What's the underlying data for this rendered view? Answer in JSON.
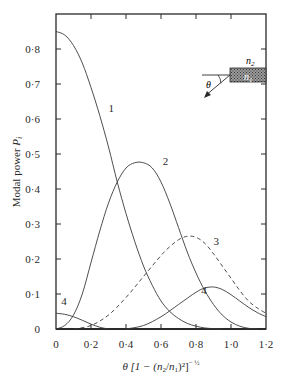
{
  "chart_data": {
    "type": "line",
    "title": "",
    "xlabel": "θ [1 − (n2/n1)²]^(−1/2)",
    "ylabel": "Modal power P_i",
    "xlim": [
      0,
      1.2
    ],
    "ylim": [
      0,
      0.9
    ],
    "grid": false,
    "legend": "none (curves labelled inline 1–4)",
    "x_ticks": [
      "0",
      "0·2",
      "0·4",
      "0·6",
      "0·8",
      "1·0",
      "1·2"
    ],
    "y_ticks": [
      "0",
      "0·1",
      "0·2",
      "0·3",
      "0·4",
      "0·5",
      "0·6",
      "0·7",
      "0·8"
    ],
    "inset": {
      "labels": [
        "n2",
        "n1",
        "θ"
      ],
      "description": "fibre end-face with ray incident at angle θ"
    },
    "series": [
      {
        "name": "1",
        "style": "solid",
        "x": [
          0,
          0.05,
          0.1,
          0.15,
          0.2,
          0.25,
          0.3,
          0.35,
          0.4,
          0.45,
          0.5,
          0.55,
          0.6,
          0.65,
          0.7,
          0.75,
          0.8,
          0.85,
          0.9,
          0.95
        ],
        "y": [
          0.85,
          0.84,
          0.81,
          0.76,
          0.69,
          0.61,
          0.52,
          0.42,
          0.33,
          0.25,
          0.18,
          0.125,
          0.08,
          0.05,
          0.03,
          0.016,
          0.008,
          0.003,
          0.001,
          0
        ]
      },
      {
        "name": "2",
        "style": "solid",
        "x": [
          0,
          0.05,
          0.1,
          0.15,
          0.2,
          0.25,
          0.3,
          0.35,
          0.4,
          0.45,
          0.5,
          0.55,
          0.6,
          0.65,
          0.7,
          0.75,
          0.8,
          0.85,
          0.9,
          0.95,
          1.0,
          1.05,
          1.1,
          1.15
        ],
        "y": [
          0,
          0.01,
          0.04,
          0.1,
          0.19,
          0.28,
          0.36,
          0.42,
          0.46,
          0.475,
          0.475,
          0.46,
          0.42,
          0.36,
          0.29,
          0.22,
          0.16,
          0.11,
          0.07,
          0.04,
          0.02,
          0.008,
          0.002,
          0
        ]
      },
      {
        "name": "3",
        "style": "dashed",
        "x": [
          0.1,
          0.2,
          0.3,
          0.4,
          0.5,
          0.6,
          0.65,
          0.7,
          0.75,
          0.8,
          0.85,
          0.9,
          0.95,
          1.0,
          1.05,
          1.1,
          1.15,
          1.2
        ],
        "y": [
          0,
          0.01,
          0.04,
          0.09,
          0.15,
          0.21,
          0.235,
          0.255,
          0.265,
          0.262,
          0.245,
          0.215,
          0.18,
          0.145,
          0.11,
          0.08,
          0.06,
          0.045
        ]
      },
      {
        "name": "4",
        "style": "solid",
        "x": [
          0,
          0.05,
          0.1,
          0.15,
          0.2,
          0.25,
          0.3
        ],
        "y": [
          0.045,
          0.042,
          0.035,
          0.025,
          0.014,
          0.005,
          0
        ]
      },
      {
        "name": "4",
        "style": "solid",
        "x": [
          0.4,
          0.5,
          0.6,
          0.7,
          0.8,
          0.85,
          0.9,
          0.95,
          1.0,
          1.05,
          1.1,
          1.15,
          1.2
        ],
        "y": [
          0,
          0.01,
          0.035,
          0.07,
          0.105,
          0.117,
          0.12,
          0.113,
          0.098,
          0.08,
          0.062,
          0.047,
          0.035
        ]
      }
    ],
    "curve_labels": [
      {
        "text": "1",
        "x": 0.3,
        "y": 0.62
      },
      {
        "text": "2",
        "x": 0.61,
        "y": 0.47
      },
      {
        "text": "3",
        "x": 0.9,
        "y": 0.24
      },
      {
        "text": "4",
        "x": 0.83,
        "y": 0.1
      },
      {
        "text": "4",
        "x": 0.03,
        "y": 0.07
      }
    ]
  },
  "axes": {
    "ylabel_main": "Modal power ",
    "ylabel_var": "P",
    "ylabel_sub": "i",
    "xlabel_theta": "θ [1 − (",
    "xlabel_n2": "n",
    "xlabel_n2_sub": "2",
    "xlabel_slash": "/",
    "xlabel_n1": "n",
    "xlabel_n1_sub": "1",
    "xlabel_close": ")²]",
    "xlabel_exp": "− ½"
  },
  "inset": {
    "n2": "n",
    "n2_sub": "2",
    "n1": "n",
    "n1_sub": "1",
    "theta": "θ"
  }
}
